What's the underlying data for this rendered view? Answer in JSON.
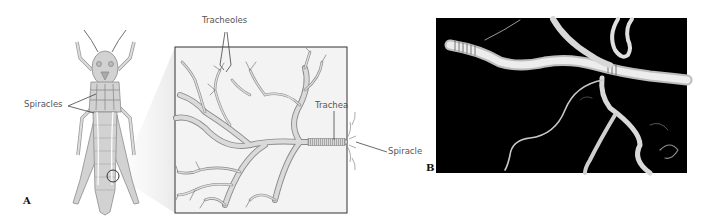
{
  "figure": {
    "panel_a": {
      "label": "A",
      "callouts": {
        "spiracles": "Spiracles",
        "tracheoles": "Tracheoles",
        "trachea": "Trachea",
        "spiracle": "Spiracle"
      }
    },
    "panel_b": {
      "label": "B"
    }
  },
  "colors": {
    "line": "#444444",
    "tube_fill": "#d9d9d9",
    "tube_stroke": "#8a8a8a",
    "body_fill": "#cfcfcf",
    "photo_bg": "#000000",
    "photo_tube": "#e6e6e6"
  }
}
